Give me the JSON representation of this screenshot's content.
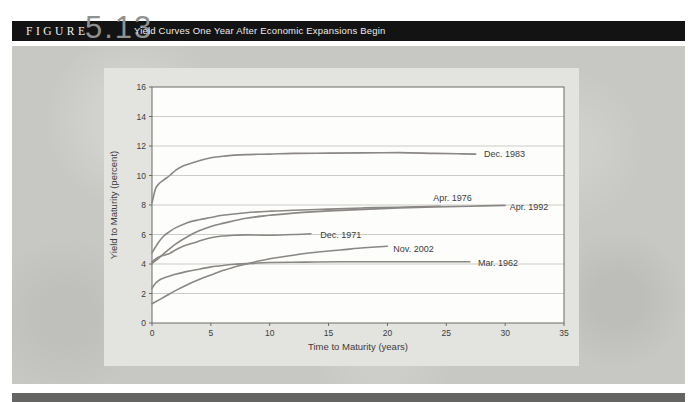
{
  "figure": {
    "label": "FIGURE",
    "number": "5.13",
    "title": "Yield Curves One Year After Economic Expansions Begin"
  },
  "colors": {
    "header_bg": "#131313",
    "figure_number": "#8f9190",
    "band_bg": "#c7c8c3",
    "panel_bg": "#e3e4df",
    "plot_bg": "#fdfdfb",
    "axis_frame": "#6a6a68",
    "grid": "#cbccc7",
    "curve": "#8a8784",
    "text": "#3c3c3c",
    "bottom_bar": "#646462"
  },
  "chart_data": {
    "type": "line",
    "title": "Yield Curves One Year After Economic Expansions Begin",
    "xlabel": "Time to Maturity (years)",
    "ylabel": "Yield to Maturity (percent)",
    "xlim": [
      0,
      35
    ],
    "ylim": [
      0,
      16
    ],
    "xticks": [
      0,
      5,
      10,
      15,
      20,
      25,
      30,
      35
    ],
    "yticks": [
      0,
      2,
      4,
      6,
      8,
      10,
      12,
      14,
      16
    ],
    "grid": "horizontal",
    "legend_position": "inline-labels",
    "series": [
      {
        "name": "Dec. 1983",
        "x": [
          0,
          0.3,
          0.6,
          1,
          1.5,
          2,
          2.5,
          3,
          4,
          5,
          6,
          7,
          8,
          10,
          12,
          15,
          18,
          21,
          24,
          26,
          27.5
        ],
        "y": [
          8.15,
          9.1,
          9.45,
          9.7,
          10.0,
          10.35,
          10.6,
          10.75,
          11.0,
          11.2,
          11.3,
          11.38,
          11.42,
          11.45,
          11.5,
          11.52,
          11.53,
          11.55,
          11.5,
          11.47,
          11.45
        ],
        "label_x": 28.2,
        "label_y": 11.45
      },
      {
        "name": "Apr. 1976",
        "x": [
          0,
          0.5,
          1,
          1.5,
          2,
          3,
          4,
          5,
          6,
          8,
          10,
          12,
          15,
          18,
          21,
          24.5
        ],
        "y": [
          4.75,
          5.4,
          5.9,
          6.2,
          6.45,
          6.8,
          7.0,
          7.15,
          7.3,
          7.48,
          7.58,
          7.65,
          7.72,
          7.8,
          7.85,
          7.92
        ],
        "label_x": 23.9,
        "label_y": 8.45
      },
      {
        "name": "Apr. 1992",
        "x": [
          0,
          0.5,
          1,
          2,
          3,
          4,
          5,
          6,
          8,
          10,
          12,
          15,
          18,
          21,
          24,
          27,
          30
        ],
        "y": [
          4.05,
          4.35,
          4.7,
          5.35,
          5.85,
          6.25,
          6.55,
          6.75,
          7.1,
          7.3,
          7.45,
          7.6,
          7.7,
          7.8,
          7.87,
          7.92,
          7.97
        ],
        "label_x": 30.4,
        "label_y": 7.85
      },
      {
        "name": "Dec. 1971",
        "x": [
          0,
          0.5,
          1,
          1.5,
          2,
          2.5,
          3,
          4,
          5,
          6,
          7,
          8,
          10,
          12,
          13.5
        ],
        "y": [
          4.15,
          4.45,
          4.6,
          4.72,
          4.95,
          5.15,
          5.3,
          5.55,
          5.78,
          5.9,
          5.95,
          5.97,
          5.95,
          6.0,
          6.05
        ],
        "label_x": 14.3,
        "label_y": 6.0
      },
      {
        "name": "Nov. 2002",
        "x": [
          0,
          1,
          2,
          3,
          4,
          5,
          6,
          7,
          8,
          10,
          12,
          14,
          16,
          18,
          20
        ],
        "y": [
          1.3,
          1.75,
          2.2,
          2.6,
          2.95,
          3.25,
          3.55,
          3.8,
          4.0,
          4.35,
          4.6,
          4.8,
          4.95,
          5.1,
          5.2
        ],
        "label_x": 20.5,
        "label_y": 5.05
      },
      {
        "name": "Mar. 1962",
        "x": [
          0,
          0.3,
          0.7,
          1,
          1.5,
          2,
          3,
          4,
          5,
          6,
          7,
          8,
          10,
          13,
          16,
          20,
          24,
          27
        ],
        "y": [
          2.35,
          2.7,
          2.95,
          3.05,
          3.18,
          3.3,
          3.5,
          3.65,
          3.8,
          3.9,
          3.98,
          4.03,
          4.1,
          4.13,
          4.15,
          4.15,
          4.15,
          4.15
        ],
        "label_x": 27.7,
        "label_y": 4.1
      }
    ]
  }
}
